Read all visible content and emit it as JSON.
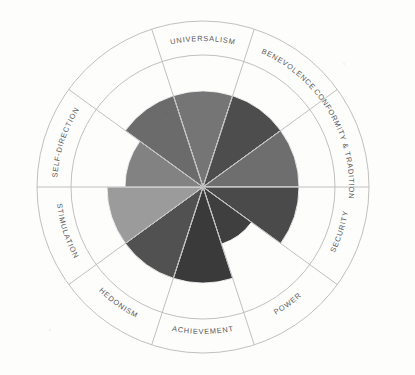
{
  "figure": {
    "type": "values-circumplex-wheel",
    "center_x": 203,
    "center_y": 187,
    "outer_radius": 166,
    "inner_ring_radius": 132,
    "label_ring_radius": 149,
    "pie_max_radius": 96,
    "background_color": "#fdfdfc",
    "ring_stroke_color": "#b9b9b9"
  },
  "chart_data": {
    "type": "pie",
    "title": "",
    "subtitle": "",
    "xlabel": "",
    "ylabel": "",
    "grid": false,
    "legend": "none",
    "start_angle_deg": -18,
    "sector_span_deg": 36,
    "categories": [
      "UNIVERSALISM",
      "BENEVOLENCE",
      "CONFORMITY & TRADITION",
      "SECURITY",
      "POWER",
      "ACHIEVEMENT",
      "HEDONISM",
      "STIMULATION",
      "SELF-DIRECTION"
    ],
    "slices": [
      {
        "label": "UNIVERSALISM",
        "index": 0,
        "radius": 96,
        "value": 100,
        "color": "#757575"
      },
      {
        "label": "BENEVOLENCE",
        "index": 1,
        "radius": 96,
        "value": 100,
        "color": "#4d4d4d"
      },
      {
        "label": "CONFORMITY & TRADITION",
        "index": 2,
        "radius": 96,
        "value": 100,
        "color": "#6e6e6e"
      },
      {
        "label": "SECURITY",
        "index": 3,
        "radius": 96,
        "value": 100,
        "color": "#4a4a4a"
      },
      {
        "label": "POWER",
        "index": 4,
        "radius": 60,
        "value": 62,
        "color": "#3f3f3f"
      },
      {
        "label": "ACHIEVEMENT",
        "index": 5,
        "radius": 96,
        "value": 100,
        "color": "#3a3a3a"
      },
      {
        "label": "HEDONISM",
        "index": 6,
        "radius": 96,
        "value": 100,
        "color": "#515151"
      },
      {
        "label": "STIMULATION",
        "index": 7,
        "radius": 96,
        "value": 100,
        "color": "#9b9b9b"
      },
      {
        "label": "SELF-DIRECTION",
        "index": 8,
        "radius": 78,
        "value": 81,
        "color": "#828282"
      },
      {
        "label": "UNIVERSALISM-B",
        "index": 9,
        "radius": 96,
        "value": 100,
        "color": "#6b6b6b"
      }
    ],
    "sector_count": 10,
    "ylim": [
      0,
      100
    ]
  },
  "labels": {
    "universalism": "UNIVERSALISM",
    "benevolence": "BENEVOLENCE",
    "conformity_tradition": "CONFORMITY & TRADITION",
    "security": "SECURITY",
    "power": "POWER",
    "achievement": "ACHIEVEMENT",
    "hedonism": "HEDONISM",
    "stimulation": "STIMULATION",
    "self_direction": "SELF-DIRECTION"
  }
}
